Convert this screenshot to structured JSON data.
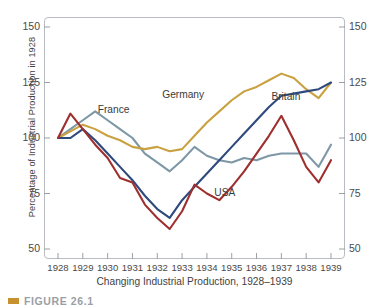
{
  "figure": {
    "caption_marker_color": "#c8912f",
    "caption_text": "FIGURE 26.1"
  },
  "chart_data": {
    "type": "line",
    "title": "",
    "xlabel": "Changing Industrial Production, 1928–1939",
    "ylabel": "Percentage of Industrial Production in 1928",
    "xlim": [
      1928,
      1939
    ],
    "ylim": [
      50,
      150
    ],
    "yticks": [
      50,
      75,
      100,
      125,
      150
    ],
    "ytick_labels_left": [
      "150",
      "125",
      "100",
      "75",
      "50"
    ],
    "ytick_labels_right": [
      "150",
      "125",
      "100",
      "75",
      "50"
    ],
    "xticks": [
      1928,
      1929,
      1930,
      1931,
      1932,
      1933,
      1934,
      1935,
      1936,
      1937,
      1938,
      1939
    ],
    "xtick_labels": [
      "1928",
      "1929",
      "1930",
      "1931",
      "1932",
      "1933",
      "1934",
      "1935",
      "1936",
      "1937",
      "1938",
      "1939"
    ],
    "grid": false,
    "legend_position": "inline-on-curves",
    "x": [
      1928.0,
      1928.5,
      1929.0,
      1929.5,
      1930.0,
      1930.5,
      1931.0,
      1931.5,
      1932.0,
      1932.5,
      1933.0,
      1933.5,
      1934.0,
      1934.5,
      1935.0,
      1935.5,
      1936.0,
      1936.5,
      1937.0,
      1937.5,
      1938.0,
      1938.5,
      1939.0
    ],
    "series": [
      {
        "name": "France",
        "color": "#7e97a6",
        "values": [
          100,
          104,
          108,
          112,
          108,
          104,
          100,
          93,
          89,
          85,
          90,
          96,
          92,
          90,
          89,
          91,
          90,
          92,
          93,
          93,
          93,
          87,
          97
        ],
        "label_x": 1929.6,
        "label_y": 112
      },
      {
        "name": "Germany",
        "color": "#c9a13f",
        "values": [
          100,
          103,
          106,
          104,
          101,
          99,
          96,
          95,
          96,
          94,
          95,
          101,
          107,
          112,
          117,
          121,
          123,
          126,
          129,
          127,
          122,
          118,
          125
        ],
        "label_x": 1932.2,
        "label_y": 119
      },
      {
        "name": "Britain",
        "color": "#2e4a7d",
        "values": [
          100,
          100,
          104,
          99,
          93,
          87,
          81,
          74,
          68,
          64,
          72,
          78,
          84,
          90,
          96,
          102,
          108,
          114,
          119,
          120,
          121,
          122,
          125
        ],
        "label_x": 1936.6,
        "label_y": 118
      },
      {
        "name": "USA",
        "color": "#9e2f2e",
        "values": [
          100,
          111,
          104,
          97,
          91,
          82,
          80,
          70,
          64,
          59,
          67,
          79,
          75,
          72,
          78,
          85,
          93,
          101,
          110,
          99,
          87,
          80,
          90
        ],
        "label_x": 1934.3,
        "label_y": 75
      }
    ]
  }
}
